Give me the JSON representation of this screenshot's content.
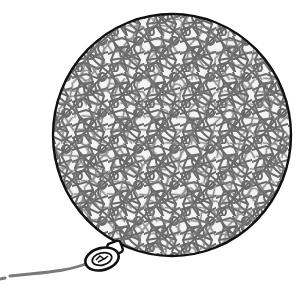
{
  "image": {
    "subject": "balloon illustration",
    "description": "Round balloon filled with a gray crackle / mesh web pattern, black outline, tied knot at lower-left with a gray string trailing left",
    "colors": {
      "background": "#ffffff",
      "outline": "#111111",
      "mesh_lines": "#6b6b6b",
      "mesh_fill": "#f2f2f2",
      "string": "#7a7a7a",
      "knot": "#111111"
    }
  }
}
